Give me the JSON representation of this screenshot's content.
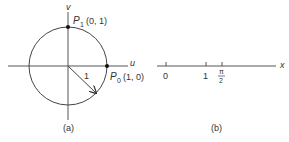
{
  "panel_a": {
    "caption": "(a)",
    "axis_u": "u",
    "axis_v": "v",
    "p1_name": "P",
    "p1_sub": "1",
    "p1_coords": "(0, 1)",
    "p0_name": "P",
    "p0_sub": "0",
    "p0_coords": "(1, 0)",
    "radius_label": "1"
  },
  "panel_b": {
    "caption": "(b)",
    "axis_x": "x",
    "ticks": [
      {
        "label": "0"
      },
      {
        "label": "1"
      },
      {
        "label_num": "π",
        "label_den": "2"
      }
    ]
  },
  "colors": {
    "ink": "#333333",
    "background": "#ffffff"
  }
}
